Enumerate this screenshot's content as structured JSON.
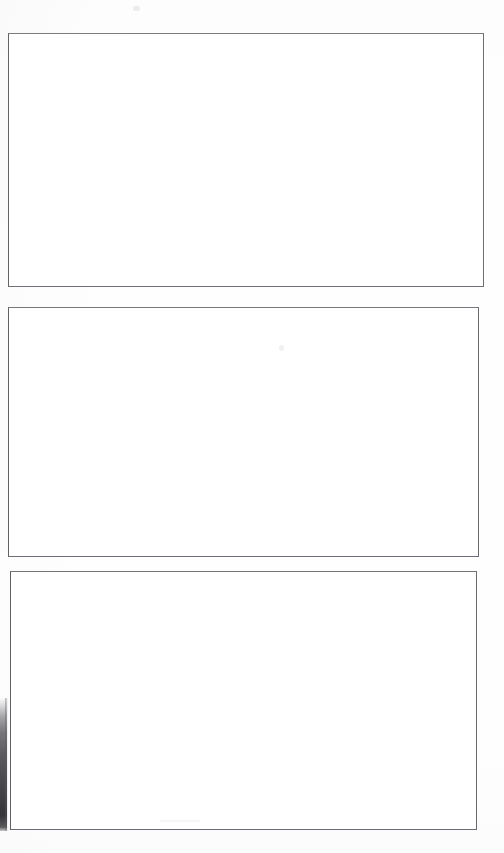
{
  "page": {
    "kind": "scanned-document-page",
    "width": 504,
    "height": 853,
    "background_color": "#fefefe",
    "visible_text": "",
    "note": "Page contains no rendered text; only three empty rectangular frames."
  },
  "frames": [
    {
      "id": "frame-1",
      "label": "",
      "content": "",
      "border_color": "#6e6e74",
      "fill_color": "#ffffff",
      "x": 8,
      "y": 33,
      "width": 476,
      "height": 254
    },
    {
      "id": "frame-2",
      "label": "",
      "content": "",
      "border_color": "#6b6b72",
      "fill_color": "#ffffff",
      "x": 8,
      "y": 307,
      "width": 471,
      "height": 250
    },
    {
      "id": "frame-3",
      "label": "",
      "content": "",
      "border_color": "#6a6a71",
      "fill_color": "#ffffff",
      "x": 10,
      "y": 571,
      "width": 467,
      "height": 259
    }
  ],
  "artifacts": {
    "scan_edge": {
      "label": "",
      "color": "#3a3a40",
      "x": 0,
      "y": 698,
      "width": 7,
      "height": 133
    },
    "speckles": [
      {
        "label": "",
        "x": 133,
        "y": 6,
        "color": "#9696a0"
      },
      {
        "label": "",
        "x": 279,
        "y": 345,
        "color": "#9696a0"
      },
      {
        "label": "",
        "x": 160,
        "y": 820,
        "color": "#aaaab2"
      }
    ]
  }
}
